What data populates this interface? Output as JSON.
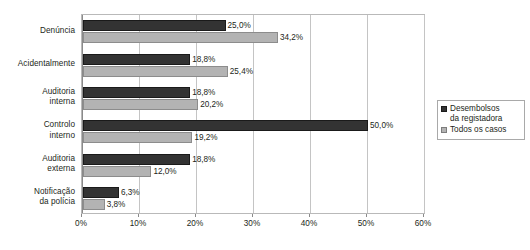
{
  "chart_data": {
    "type": "bar",
    "orientation": "horizontal",
    "title": "",
    "xlabel": "",
    "ylabel": "",
    "xlim": [
      0,
      60
    ],
    "xticks": [
      0,
      10,
      20,
      30,
      40,
      50,
      60
    ],
    "xtick_labels": [
      "0%",
      "10%",
      "20%",
      "30%",
      "40%",
      "50%",
      "60%"
    ],
    "grid": true,
    "legend_position": "right",
    "categories": [
      "Denúncia",
      "Acidentalmente",
      "Auditoria\ninterna",
      "Controlo\ninterno",
      "Auditoria\nexterna",
      "Notificação\nda polícia"
    ],
    "series": [
      {
        "name": "Desembolsos da registadora",
        "color": "#333333",
        "values": [
          25.0,
          18.8,
          18.8,
          50.0,
          18.8,
          6.3
        ],
        "labels": [
          "25,0%",
          "18,8%",
          "18,8%",
          "50,0%",
          "18,8%",
          "6,3%"
        ]
      },
      {
        "name": "Todos os casos",
        "color": "#b3b3b3",
        "values": [
          34.2,
          25.4,
          20.2,
          19.2,
          12.0,
          3.8
        ],
        "labels": [
          "34,2%",
          "25,4%",
          "20,2%",
          "19,2%",
          "12,0%",
          "3,8%"
        ]
      }
    ]
  },
  "legend": {
    "items": [
      {
        "label": "Desembolsos\nda registadora",
        "swatch": "dark-square-icon"
      },
      {
        "label": "Todos os casos",
        "swatch": "gray-square-icon"
      }
    ]
  }
}
